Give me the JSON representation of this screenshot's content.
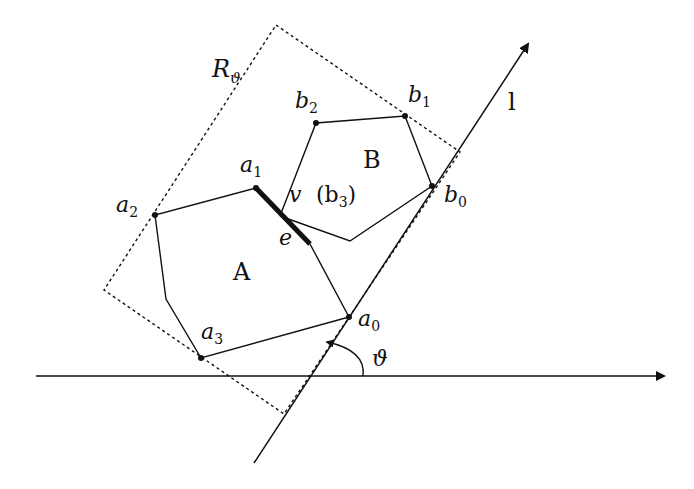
{
  "diagram": {
    "title": "",
    "colors": {
      "stroke": "#111111",
      "background": "#ffffff"
    },
    "labels": {
      "region": "R",
      "region_sub": "ϑ",
      "line": "l",
      "polygon_a": "A",
      "polygon_b": "B",
      "a0": "a",
      "a0_sub": "0",
      "a1": "a",
      "a1_sub": "1",
      "a2": "a",
      "a2_sub": "2",
      "a3": "a",
      "a3_sub": "3",
      "b0": "b",
      "b0_sub": "0",
      "b1": "b",
      "b1_sub": "1",
      "b2": "b",
      "b2_sub": "2",
      "v": "v",
      "b3_open": "(b",
      "b3_sub": "3",
      "b3_close": ")",
      "edge": "e",
      "angle": "ϑ"
    },
    "points": {
      "a0": [
        349,
        317
      ],
      "a1": [
        256,
        188
      ],
      "a2": [
        155,
        215
      ],
      "a3": [
        201,
        358
      ],
      "a_bend": [
        166,
        299
      ],
      "a_low": [
        310,
        244
      ],
      "b0": [
        432,
        186
      ],
      "b1": [
        405,
        116
      ],
      "b2": [
        316,
        123
      ],
      "b3": [
        280,
        216
      ],
      "b_low": [
        350,
        241
      ]
    }
  }
}
